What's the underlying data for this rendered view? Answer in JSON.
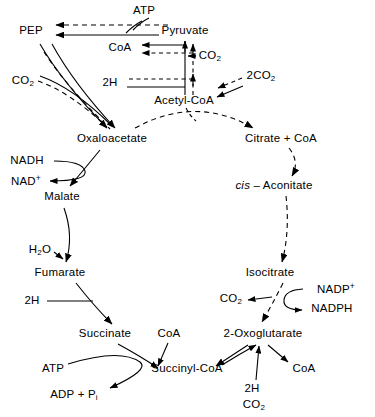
{
  "diagram": {
    "type": "metabolic-pathway",
    "stroke_color": "#000000",
    "background_color": "#ffffff",
    "line_styles": {
      "solid": "enzymatic reaction",
      "dashed": "alternate or regulatory route"
    },
    "nodes": [
      {
        "id": "atp_top",
        "label": "ATP",
        "x": 144,
        "y": 11,
        "kind": "cofactor"
      },
      {
        "id": "pep",
        "label": "PEP",
        "x": 31,
        "y": 31,
        "kind": "metabolite"
      },
      {
        "id": "pyruvate",
        "label": "Pyruvate",
        "x": 185,
        "y": 31,
        "kind": "metabolite"
      },
      {
        "id": "coa_pyr",
        "label": "CoA",
        "x": 120,
        "y": 48,
        "kind": "cofactor"
      },
      {
        "id": "co2_pyr",
        "label": "CO2",
        "x": 207,
        "y": 56,
        "kind": "cofactor"
      },
      {
        "id": "co2_pep",
        "label": "CO2",
        "x": 23,
        "y": 81,
        "kind": "cofactor"
      },
      {
        "id": "h2_acetyl",
        "label": "2H",
        "x": 110,
        "y": 76,
        "kind": "cofactor"
      },
      {
        "id": "co2_2_right",
        "label": "2CO2",
        "x": 258,
        "y": 76,
        "kind": "cofactor"
      },
      {
        "id": "acetyl_coa",
        "label": "Acetyl-CoA",
        "x": 184,
        "y": 101,
        "kind": "metabolite"
      },
      {
        "id": "oxaloacetate",
        "label": "Oxaloacetate",
        "x": 112,
        "y": 139,
        "kind": "metabolite"
      },
      {
        "id": "citrate_coa",
        "label": "Citrate + CoA",
        "x": 280,
        "y": 139,
        "kind": "metabolite"
      },
      {
        "id": "nadh",
        "label": "NADH",
        "x": 27,
        "y": 161,
        "kind": "cofactor"
      },
      {
        "id": "nad_plus",
        "label": "NAD+",
        "x": 24,
        "y": 180,
        "kind": "cofactor"
      },
      {
        "id": "cis_aconitate",
        "label": "cis-Aconitate",
        "x": 273,
        "y": 186,
        "kind": "metabolite"
      },
      {
        "id": "malate",
        "label": "Malate",
        "x": 62,
        "y": 197,
        "kind": "metabolite"
      },
      {
        "id": "h2o",
        "label": "H2O",
        "x": 40,
        "y": 250,
        "kind": "cofactor"
      },
      {
        "id": "isocitrate",
        "label": "Isocitrate",
        "x": 270,
        "y": 273,
        "kind": "metabolite"
      },
      {
        "id": "fumarate",
        "label": "Fumarate",
        "x": 60,
        "y": 273,
        "kind": "metabolite"
      },
      {
        "id": "nadp_plus",
        "label": "NADP+",
        "x": 334,
        "y": 289,
        "kind": "cofactor"
      },
      {
        "id": "co2_isocit",
        "label": "CO2",
        "x": 231,
        "y": 299,
        "kind": "cofactor"
      },
      {
        "id": "h2_fum",
        "label": "2H",
        "x": 32,
        "y": 301,
        "kind": "cofactor"
      },
      {
        "id": "nadph",
        "label": "NADPH",
        "x": 331,
        "y": 309,
        "kind": "cofactor"
      },
      {
        "id": "succinate",
        "label": "Succinate",
        "x": 105,
        "y": 334,
        "kind": "metabolite"
      },
      {
        "id": "coa_succ",
        "label": "CoA",
        "x": 167,
        "y": 334,
        "kind": "cofactor"
      },
      {
        "id": "oxoglutarate",
        "label": "2-Oxoglutarate",
        "x": 262,
        "y": 334,
        "kind": "metabolite"
      },
      {
        "id": "atp_succ",
        "label": "ATP",
        "x": 53,
        "y": 369,
        "kind": "cofactor"
      },
      {
        "id": "succinyl_coa",
        "label": "Succinyl-CoA",
        "x": 186,
        "y": 369,
        "kind": "metabolite"
      },
      {
        "id": "coa_oxo",
        "label": "CoA",
        "x": 303,
        "y": 369,
        "kind": "cofactor"
      },
      {
        "id": "adp_pi",
        "label": "ADP + Pi",
        "x": 72,
        "y": 395,
        "kind": "cofactor"
      },
      {
        "id": "h2_oxo",
        "label": "2H",
        "x": 252,
        "y": 389,
        "kind": "cofactor"
      },
      {
        "id": "co2_oxo",
        "label": "CO2",
        "x": 254,
        "y": 405,
        "kind": "cofactor"
      }
    ],
    "edges": [
      {
        "from": "pyruvate",
        "to": "pep",
        "style": "solid",
        "note": "PEP carboxykinase / pyruvate kinase reverse"
      },
      {
        "from": "atp_top",
        "to": "pep",
        "style": "dashed",
        "note": "ATP consumed"
      },
      {
        "from": "pyruvate",
        "to": "acetyl_coa",
        "style": "solid",
        "note": "pyruvate dehydrogenase"
      },
      {
        "from": "coa_pyr",
        "to": "pyruvate",
        "style": "solid",
        "note": "CoA input"
      },
      {
        "from": "co2_pyr",
        "to": "pyruvate",
        "style": "solid",
        "note": "CO2 released"
      },
      {
        "from": "h2_acetyl",
        "to": "acetyl_coa",
        "style": "solid",
        "note": "2H released"
      },
      {
        "from": "co2_2_right",
        "to": "acetyl_coa",
        "style": "dashed",
        "note": "net 2CO2 from cycle"
      },
      {
        "from": "pep",
        "to": "oxaloacetate",
        "style": "solid",
        "note": "PEP carboxylase"
      },
      {
        "from": "co2_pep",
        "to": "oxaloacetate",
        "style": "dashed",
        "note": "CO2 fixation"
      },
      {
        "from": "acetyl_coa",
        "to": "citrate_coa",
        "style": "dashed",
        "note": "citrate synthase"
      },
      {
        "from": "oxaloacetate",
        "to": "citrate_coa",
        "style": "dashed",
        "note": "condensation arc"
      },
      {
        "from": "citrate_coa",
        "to": "cis_aconitate",
        "style": "dashed",
        "note": "aconitase"
      },
      {
        "from": "cis_aconitate",
        "to": "isocitrate",
        "style": "dashed",
        "note": "aconitase"
      },
      {
        "from": "isocitrate",
        "to": "oxoglutarate",
        "style": "dashed",
        "note": "isocitrate dehydrogenase"
      },
      {
        "from": "nadp_plus",
        "to": "nadph",
        "style": "solid",
        "note": "NADP+ reduced"
      },
      {
        "from": "isocitrate",
        "to": "co2_isocit",
        "style": "dashed",
        "note": "CO2 released"
      },
      {
        "from": "oxoglutarate",
        "to": "succinyl_coa",
        "style": "solid",
        "note": "2-oxoglutarate dehydrogenase"
      },
      {
        "from": "coa_oxo",
        "to": "oxoglutarate",
        "style": "solid",
        "note": "CoA input"
      },
      {
        "from": "h2_oxo",
        "to": "oxoglutarate",
        "style": "solid",
        "note": "2H released"
      },
      {
        "from": "succinyl_coa",
        "to": "succinate",
        "style": "solid",
        "note": "succinyl-CoA synthetase"
      },
      {
        "from": "succinate",
        "to": "succinyl_coa",
        "style": "solid",
        "note": "reverse direction shown"
      },
      {
        "from": "coa_succ",
        "to": "succinyl_coa",
        "style": "solid",
        "note": "CoA"
      },
      {
        "from": "atp_succ",
        "to": "adp_pi",
        "style": "solid",
        "note": "substrate-level phosphorylation"
      },
      {
        "from": "succinate",
        "to": "fumarate",
        "style": "solid",
        "note": "succinate dehydrogenase (reverse drawn)"
      },
      {
        "from": "h2_fum",
        "to": "fumarate",
        "style": "solid",
        "note": "2H"
      },
      {
        "from": "fumarate",
        "to": "malate",
        "style": "solid",
        "note": "fumarase"
      },
      {
        "from": "h2o",
        "to": "fumarate",
        "style": "solid",
        "note": "H2O"
      },
      {
        "from": "malate",
        "to": "oxaloacetate",
        "style": "solid",
        "note": "malate dehydrogenase"
      },
      {
        "from": "nadh",
        "to": "nad_plus",
        "style": "solid",
        "note": "NADH oxidised"
      }
    ]
  }
}
